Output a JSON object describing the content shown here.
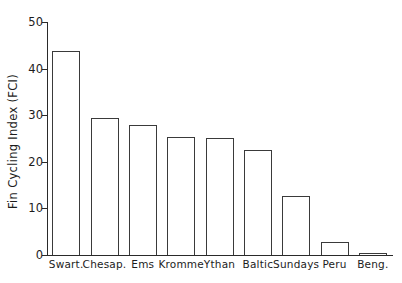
{
  "chart_data": {
    "type": "bar",
    "title": "",
    "xlabel": "",
    "ylabel": "Fin Cycling Index (FCI)",
    "categories": [
      "Swart.",
      "Chesap.",
      "Ems",
      "Kromme",
      "Ythan",
      "Baltic",
      "Sundays",
      "Peru",
      "Beng."
    ],
    "values": [
      43.8,
      29.3,
      28.0,
      25.4,
      25.1,
      22.6,
      12.6,
      2.8,
      0.4
    ],
    "ylim": [
      0,
      50
    ],
    "yticks": [
      0,
      10,
      20,
      30,
      40,
      50
    ],
    "ytick_labels": [
      "0",
      "10",
      "20",
      "30",
      "40",
      "50"
    ],
    "grid": false,
    "legend": false,
    "bar_facecolor": "#ffffff",
    "bar_edgecolor": "#3a3a3a",
    "axis_color": "#2a2a2a"
  }
}
